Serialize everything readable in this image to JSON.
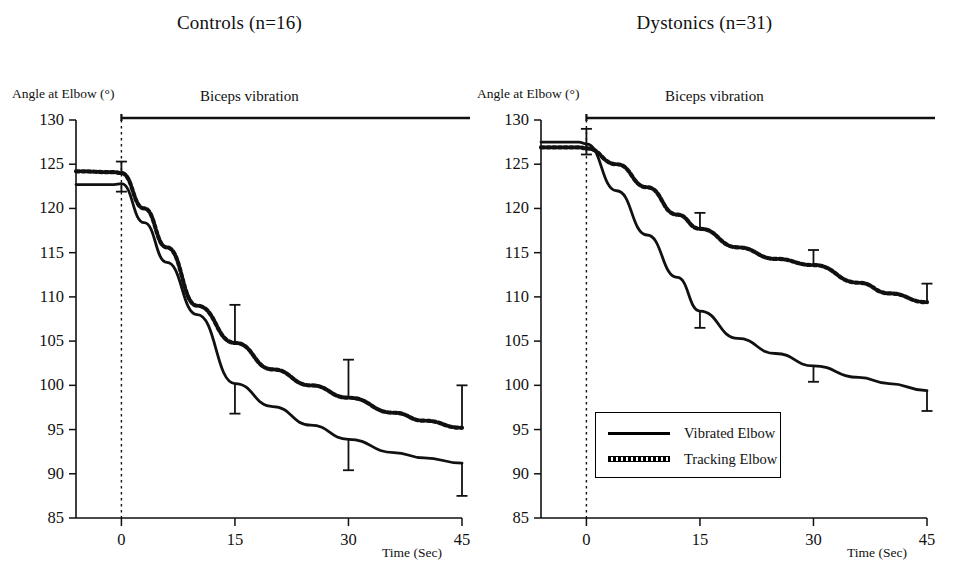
{
  "figure": {
    "background": "#ffffff",
    "line_color": "#000000"
  },
  "panels": [
    {
      "id": "controls",
      "title": "Controls (n=16)",
      "y_axis_label": "Angle at Elbow (°)",
      "x_axis_label": "Time (Sec)",
      "vibration_label": "Biceps vibration"
    },
    {
      "id": "dystonics",
      "title": "Dystonics (n=31)",
      "y_axis_label": "Angle at Elbow (°)",
      "x_axis_label": "Time (Sec)",
      "vibration_label": "Biceps vibration"
    }
  ],
  "legend": {
    "entries": [
      {
        "label": "Vibrated Elbow",
        "style": "solid"
      },
      {
        "label": "Tracking Elbow",
        "style": "dotted"
      }
    ]
  },
  "chart_data": [
    {
      "type": "line",
      "title": "Controls (n=16)",
      "xlabel": "Time (Sec)",
      "ylabel": "Angle at Elbow (°)",
      "xlim": [
        -6,
        45
      ],
      "ylim": [
        85,
        130
      ],
      "xticks": [
        0,
        15,
        30,
        45
      ],
      "yticks": [
        85,
        90,
        95,
        100,
        105,
        110,
        115,
        120,
        125,
        130
      ],
      "grid": false,
      "legend_position": "none",
      "annotations": [
        {
          "text": "Biceps vibration",
          "type": "span-bar",
          "x_start": 0,
          "x_end": 45,
          "y": 130
        },
        {
          "text": "",
          "type": "vertical-dashed-line",
          "x": 0
        }
      ],
      "series": [
        {
          "name": "Vibrated Elbow",
          "style": "solid",
          "x": [
            -6,
            -1,
            0,
            3,
            6,
            10,
            15,
            20,
            25,
            30,
            36,
            40,
            45
          ],
          "values": [
            122.7,
            122.7,
            122.8,
            118.4,
            113.9,
            108.0,
            100.2,
            97.6,
            95.5,
            93.9,
            92.4,
            91.8,
            91.2
          ],
          "error_bars": [
            {
              "x": 0,
              "value": 122.8,
              "err_low": 0.9,
              "err_high": 0.0
            },
            {
              "x": 15,
              "value": 100.2,
              "err_low": 3.4,
              "err_high": 0.0
            },
            {
              "x": 30,
              "value": 93.9,
              "err_low": 3.5,
              "err_high": 0.0
            },
            {
              "x": 45,
              "value": 91.2,
              "err_low": 3.7,
              "err_high": 0.0
            }
          ]
        },
        {
          "name": "Tracking Elbow",
          "style": "dotted",
          "x": [
            -6,
            -1,
            0,
            3,
            6,
            10,
            15,
            20,
            25,
            30,
            36,
            40,
            45
          ],
          "values": [
            124.2,
            124.1,
            124.0,
            120.0,
            115.6,
            109.0,
            104.8,
            101.8,
            100.0,
            98.6,
            96.9,
            96.0,
            95.2
          ],
          "error_bars": [
            {
              "x": 0,
              "value": 124.0,
              "err_low": 0.0,
              "err_high": 1.3
            },
            {
              "x": 15,
              "value": 104.8,
              "err_low": 0.0,
              "err_high": 4.3
            },
            {
              "x": 30,
              "value": 98.6,
              "err_low": 0.0,
              "err_high": 4.3
            },
            {
              "x": 45,
              "value": 95.2,
              "err_low": 0.0,
              "err_high": 4.8
            }
          ]
        }
      ]
    },
    {
      "type": "line",
      "title": "Dystonics (n=31)",
      "xlabel": "Time (Sec)",
      "ylabel": "Angle at Elbow (°)",
      "xlim": [
        -6,
        45
      ],
      "ylim": [
        85,
        130
      ],
      "xticks": [
        0,
        15,
        30,
        45
      ],
      "yticks": [
        85,
        90,
        95,
        100,
        105,
        110,
        115,
        120,
        125,
        130
      ],
      "grid": false,
      "legend_position": "lower-center",
      "annotations": [
        {
          "text": "Biceps vibration",
          "type": "span-bar",
          "x_start": 0,
          "x_end": 45,
          "y": 130
        },
        {
          "text": "",
          "type": "vertical-dashed-line",
          "x": 0
        }
      ],
      "series": [
        {
          "name": "Vibrated Elbow",
          "style": "solid",
          "x": [
            -6,
            -1,
            0,
            4,
            8,
            12,
            15,
            20,
            25,
            30,
            36,
            40,
            45
          ],
          "values": [
            127.5,
            127.5,
            127.3,
            122.0,
            117.0,
            112.2,
            108.4,
            105.3,
            103.6,
            102.2,
            100.9,
            100.2,
            99.4
          ],
          "error_bars": [
            {
              "x": 0,
              "value": 127.3,
              "err_low": 1.2,
              "err_high": 0.0
            },
            {
              "x": 15,
              "value": 108.4,
              "err_low": 1.9,
              "err_high": 0.0
            },
            {
              "x": 30,
              "value": 102.2,
              "err_low": 1.8,
              "err_high": 0.0
            },
            {
              "x": 45,
              "value": 99.4,
              "err_low": 2.3,
              "err_high": 0.0
            }
          ]
        },
        {
          "name": "Tracking Elbow",
          "style": "dotted",
          "x": [
            -6,
            -1,
            0,
            4,
            8,
            12,
            15,
            20,
            25,
            30,
            36,
            40,
            45
          ],
          "values": [
            126.9,
            126.9,
            126.8,
            125.0,
            122.4,
            119.3,
            117.7,
            115.6,
            114.3,
            113.6,
            111.6,
            110.4,
            109.4
          ],
          "error_bars": [
            {
              "x": 0,
              "value": 126.8,
              "err_low": 0.0,
              "err_high": 2.2
            },
            {
              "x": 15,
              "value": 117.7,
              "err_low": 0.0,
              "err_high": 1.8
            },
            {
              "x": 30,
              "value": 113.6,
              "err_low": 0.0,
              "err_high": 1.7
            },
            {
              "x": 45,
              "value": 109.4,
              "err_low": 0.0,
              "err_high": 2.1
            }
          ]
        }
      ]
    }
  ]
}
